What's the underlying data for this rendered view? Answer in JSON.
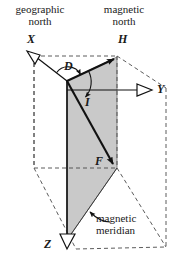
{
  "figure": {
    "title_alt": "Geomagnetic field elements diagram",
    "background_color": "#ffffff",
    "line_color": "#1a1a1a",
    "dashed_color": "#555555",
    "plane_fill": "#c9c9c9",
    "width": 178,
    "height": 267
  },
  "labels": {
    "geographic_north_line1": "geographic",
    "geographic_north_line2": "north",
    "magnetic_north_line1": "magnetic",
    "magnetic_north_line2": "north",
    "axis_x": "X",
    "axis_y": "Y",
    "axis_z": "Z",
    "vector_h": "H",
    "vector_f": "F",
    "angle_d": "D",
    "angle_i": "I",
    "magnetic_meridian_line1": "magnetic",
    "magnetic_meridian_line2": "meridian"
  },
  "geometry": {
    "origin": [
      67,
      81
    ],
    "x_tip": [
      31,
      53
    ],
    "y_tip": [
      152,
      90
    ],
    "z_tip": [
      67,
      247
    ],
    "h_tip": [
      117,
      57
    ],
    "f_tip": [
      117,
      168
    ],
    "plane_polygon": "67,81 117,57 117,168 67,240",
    "box_top_front_left": [
      34,
      56
    ],
    "box_top_front_right": [
      117,
      56
    ],
    "box_mid_left": [
      34,
      168
    ],
    "box_mid_right": [
      117,
      168
    ],
    "box_back_top_right": [
      166,
      88
    ],
    "box_back_bottom_right": [
      166,
      247
    ],
    "box_back_bottom_left": [
      90,
      249
    ]
  },
  "icons": {
    "x_arrowhead": "hollow-triangle-arrow-icon",
    "y_arrowhead": "hollow-triangle-arrow-icon",
    "z_arrowhead": "hollow-triangle-arrow-icon",
    "h_arrowhead": "solid-triangle-arrow-icon",
    "f_arrowhead": "solid-triangle-arrow-icon",
    "d_arc_arrow": "curved-arrow-icon",
    "i_arc_arrow": "curved-arrow-icon",
    "meridian_leader": "leader-arrow-icon"
  }
}
